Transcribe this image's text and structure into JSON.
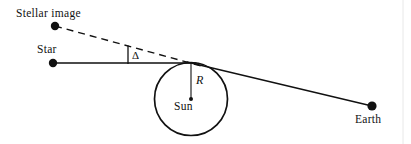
{
  "figure": {
    "width": 411,
    "height": 144,
    "background_color": "#ffffff",
    "stroke_color": "#111111"
  },
  "labels": {
    "stellar_image": "Stellar image",
    "star": "Star",
    "deflection_angle": "Δ",
    "radius": "R",
    "sun": "Sun",
    "earth": "Earth"
  },
  "points": {
    "stellar_image_dot": {
      "x": 55,
      "y": 26,
      "r": 4.2
    },
    "star_dot": {
      "x": 53,
      "y": 63,
      "r": 4.2
    },
    "tangent_point": {
      "x": 190,
      "y": 63
    },
    "sun_center": {
      "x": 191,
      "y": 99,
      "r": 2.0
    },
    "earth_dot": {
      "x": 372,
      "y": 106,
      "r": 4.6
    }
  },
  "shapes": {
    "sun_circle": {
      "cx": 191,
      "cy": 99,
      "r": 36.5,
      "stroke_width": 1.6
    },
    "radius_line": {
      "x1": 191,
      "y1": 63,
      "x2": 191,
      "y2": 99,
      "stroke_width": 1.1
    },
    "star_ray": {
      "x1": 53,
      "y1": 63,
      "x2": 196,
      "y2": 63,
      "stroke_width": 1.4
    },
    "earth_ray": {
      "x1": 188,
      "y1": 62,
      "x2": 372,
      "y2": 106,
      "stroke_width": 1.4
    },
    "apparent_ray_dashed": {
      "x1": 55,
      "y1": 26,
      "x2": 204,
      "y2": 67,
      "stroke_width": 1.4,
      "dash": "7 5"
    },
    "angle_tick": {
      "x1": 128,
      "y1": 46,
      "x2": 128,
      "y2": 64,
      "stroke_width": 1.3
    },
    "frame_line": {
      "x": 403,
      "y1": 0,
      "y2": 144,
      "stroke_width": 1.0,
      "color": "#e8e8e8"
    }
  }
}
